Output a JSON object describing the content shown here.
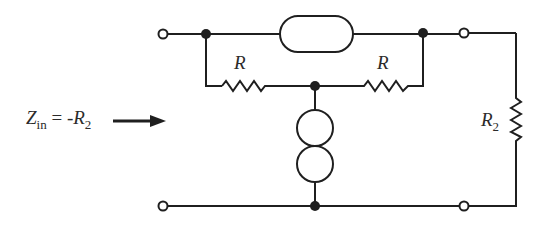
{
  "diagram": {
    "type": "circuit",
    "colors": {
      "stroke": "#1f1f1f",
      "background": "#ffffff",
      "text": "#2b2b2b"
    },
    "labels": {
      "input_impedance": {
        "main": "Z",
        "sub": "in",
        "eq": " = -",
        "rhs_main": "R",
        "rhs_sub": "2"
      },
      "resistor_left": "R",
      "resistor_right": "R",
      "load_resistor": {
        "main": "R",
        "sub": "2"
      }
    },
    "components": [
      {
        "id": "nullator",
        "symbol": "capsule",
        "position": "top branch between input and output nodes"
      },
      {
        "id": "norator",
        "symbol": "two-circles",
        "position": "vertical between resistor midpoint and ground"
      },
      {
        "id": "R_left",
        "symbol": "resistor",
        "value": "R"
      },
      {
        "id": "R_right",
        "symbol": "resistor",
        "value": "R"
      },
      {
        "id": "R2",
        "symbol": "resistor",
        "value": "R2",
        "position": "load across output terminals"
      }
    ],
    "terminals": [
      "input-top",
      "input-bottom",
      "output-top",
      "output-bottom"
    ],
    "arrow": "input impedance direction arrow pointing right into input port"
  }
}
